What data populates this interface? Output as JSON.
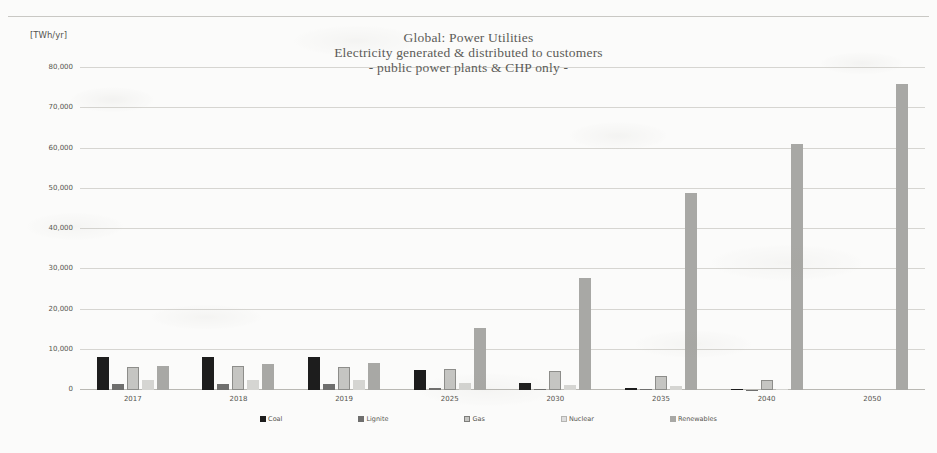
{
  "unit_label": "[TWh/yr]",
  "title": {
    "line1": "Global: Power Utilities",
    "line2": "Electricity generated & distributed to customers",
    "line3": "- public power plants & CHP only -"
  },
  "chart_data": {
    "type": "bar",
    "xlabel": "",
    "ylabel": "[TWh/yr]",
    "ylim": [
      0,
      80000
    ],
    "ytick_values": [
      0,
      10000,
      20000,
      30000,
      40000,
      50000,
      60000,
      70000,
      80000
    ],
    "ytick_labels": [
      "0",
      "10,000",
      "20,000",
      "30,000",
      "40,000",
      "50,000",
      "60,000",
      "70,000",
      "80,000"
    ],
    "grid": true,
    "legend_position": "bottom",
    "categories": [
      "2017",
      "2018",
      "2019",
      "2025",
      "2030",
      "2035",
      "2040",
      "2050"
    ],
    "series": [
      {
        "name": "Coal",
        "color": "#1d1d1d",
        "values": [
          8100,
          8300,
          8200,
          4900,
          1800,
          500,
          200,
          0
        ]
      },
      {
        "name": "Lignite",
        "color": "#6f6f6e",
        "values": [
          1500,
          1400,
          1500,
          400,
          300,
          150,
          100,
          0
        ]
      },
      {
        "name": "Gas",
        "color": "#c5c5c2",
        "values": [
          5700,
          5900,
          5800,
          5200,
          4800,
          3500,
          2400,
          0
        ]
      },
      {
        "name": "Nuclear",
        "color": "#d5d5d2",
        "values": [
          2400,
          2500,
          2500,
          1800,
          1200,
          900,
          200,
          0
        ]
      },
      {
        "name": "Renewables",
        "color": "#a8a8a5",
        "values": [
          5900,
          6400,
          6700,
          15400,
          27800,
          49000,
          61000,
          76000
        ]
      }
    ]
  },
  "legend": [
    {
      "label": "Coal",
      "key": "coal"
    },
    {
      "label": "Lignite",
      "key": "lignite"
    },
    {
      "label": "Gas",
      "key": "gas"
    },
    {
      "label": "Nuclear",
      "key": "nuclear"
    },
    {
      "label": "Renewables",
      "key": "renewables"
    }
  ]
}
